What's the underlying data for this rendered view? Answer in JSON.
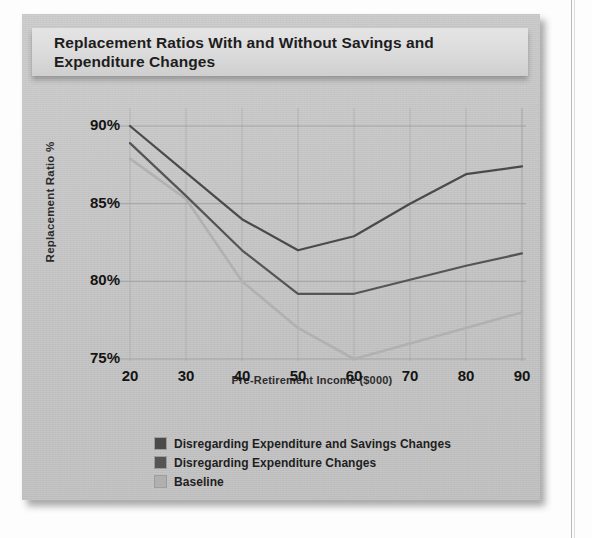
{
  "figure": {
    "title": "Replacement Ratios With and Without Savings and Expenditure Changes"
  },
  "colors": {
    "panel_background": "#c3c3c3",
    "title_banner": "#dcdcdc",
    "series_disregarding_expenditure_and_savings": "#4f4f4f",
    "series_disregarding_expenditure": "#5a5a5a",
    "series_baseline": "#a8a8a8",
    "gridline": "#9a9a9a",
    "text": "#1d1d1d"
  },
  "legend": {
    "items": [
      {
        "label": "Disregarding Expenditure and Savings Changes",
        "color": "#4a4a4a"
      },
      {
        "label": "Disregarding Expenditure Changes",
        "color": "#555555"
      },
      {
        "label": "Baseline",
        "color": "#b0b0b0"
      }
    ]
  },
  "chart_data": {
    "type": "line",
    "title": "Replacement Ratios With and Without Savings and Expenditure Changes",
    "xlabel": "Pre-Retirement Income ($000)",
    "ylabel": "Replacement Ratio %",
    "x": [
      20,
      30,
      40,
      50,
      60,
      70,
      80,
      90
    ],
    "x_tick_labels": [
      "20",
      "30",
      "40",
      "50",
      "60",
      "70",
      "80",
      "90"
    ],
    "y_tick_labels": [
      "90%",
      "85%",
      "80%",
      "75%"
    ],
    "y_ticks": [
      90,
      85,
      80,
      75
    ],
    "xlim": [
      20,
      90
    ],
    "ylim": [
      74,
      90.8
    ],
    "grid": true,
    "legend_position": "below-plot-left",
    "series": [
      {
        "name": "Disregarding Expenditure and Savings Changes",
        "color": "#4a4a4a",
        "values": [
          90.0,
          87.0,
          84.0,
          82.0,
          82.9,
          85.0,
          86.9,
          87.4
        ]
      },
      {
        "name": "Disregarding Expenditure Changes",
        "color": "#555555",
        "values": [
          88.9,
          85.5,
          82.0,
          79.2,
          79.2,
          80.1,
          81.0,
          81.8
        ]
      },
      {
        "name": "Baseline",
        "color": "#b0b0b0",
        "values": [
          87.9,
          85.3,
          80.0,
          77.0,
          75.0,
          76.0,
          77.0,
          78.0
        ]
      }
    ]
  }
}
